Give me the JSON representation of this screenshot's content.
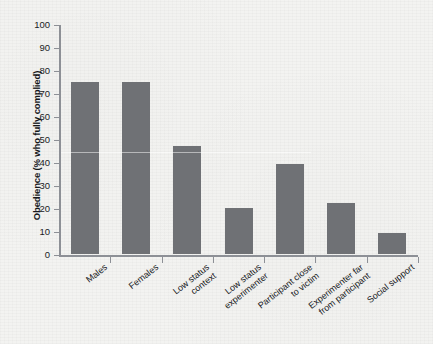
{
  "chart_data": {
    "type": "bar",
    "title": "",
    "xlabel": "",
    "ylabel": "Obedience (% who fully complied)",
    "ylim": [
      0,
      100
    ],
    "ytick_step": 10,
    "yticks": [
      100,
      90,
      80,
      70,
      60,
      50,
      40,
      30,
      20,
      10,
      0
    ],
    "grid": false,
    "legend": null,
    "bar_color": "#6f7175",
    "axis_color": "#8d9096",
    "background_color": "#f3f3f1",
    "categories": [
      "Males",
      "Females",
      "Low status\ncontext",
      "Low status\nexperimenter",
      "Participant close\nto victim",
      "Experimenter far\nfrom participant",
      "Social support"
    ],
    "values": [
      75,
      75,
      47,
      20,
      39,
      22,
      9
    ]
  },
  "axis": {
    "y_label": "Obedience (% who fully complied)",
    "y_ticks": [
      "100",
      "90",
      "80",
      "70",
      "60",
      "50",
      "40",
      "30",
      "20",
      "10",
      "0"
    ]
  },
  "categories": [
    "Males",
    "Females",
    "Low status\ncontext",
    "Low status\nexperimenter",
    "Participant close\nto victim",
    "Experimenter far\nfrom participant",
    "Social support"
  ]
}
